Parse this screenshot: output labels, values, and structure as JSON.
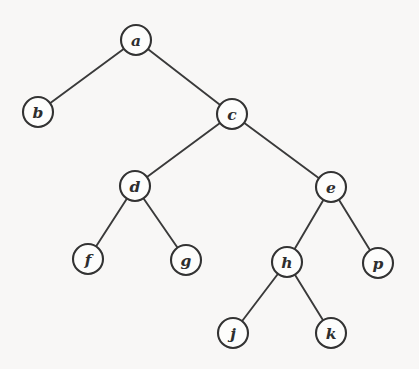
{
  "figure": {
    "background_color": "#f8f7f6",
    "stroke_color": "#333333",
    "label_color": "#2e2e2e",
    "node_fill_color": "#fdfdfc",
    "node_radius": 15
  },
  "chart_data": {
    "type": "diagram",
    "diagram_type": "binary-tree",
    "title": "",
    "root": "a",
    "nodes": [
      {
        "id": "a",
        "label": "a",
        "x": 136,
        "y": 40,
        "depth": 0
      },
      {
        "id": "b",
        "label": "b",
        "x": 38,
        "y": 112,
        "depth": 1
      },
      {
        "id": "c",
        "label": "c",
        "x": 232,
        "y": 114,
        "depth": 1
      },
      {
        "id": "d",
        "label": "d",
        "x": 135,
        "y": 186,
        "depth": 2
      },
      {
        "id": "e",
        "label": "e",
        "x": 331,
        "y": 187,
        "depth": 2
      },
      {
        "id": "f",
        "label": "f",
        "x": 88,
        "y": 259,
        "depth": 3
      },
      {
        "id": "g",
        "label": "g",
        "x": 186,
        "y": 260,
        "depth": 3
      },
      {
        "id": "h",
        "label": "h",
        "x": 287,
        "y": 262,
        "depth": 3
      },
      {
        "id": "p",
        "label": "p",
        "x": 378,
        "y": 263,
        "depth": 3
      },
      {
        "id": "j",
        "label": "j",
        "x": 233,
        "y": 333,
        "depth": 4
      },
      {
        "id": "k",
        "label": "k",
        "x": 331,
        "y": 333,
        "depth": 4
      }
    ],
    "edges": [
      {
        "from": "a",
        "to": "b",
        "side": "left"
      },
      {
        "from": "a",
        "to": "c",
        "side": "right"
      },
      {
        "from": "c",
        "to": "d",
        "side": "left"
      },
      {
        "from": "c",
        "to": "e",
        "side": "right"
      },
      {
        "from": "d",
        "to": "f",
        "side": "left"
      },
      {
        "from": "d",
        "to": "g",
        "side": "right"
      },
      {
        "from": "e",
        "to": "h",
        "side": "left"
      },
      {
        "from": "e",
        "to": "p",
        "side": "right"
      },
      {
        "from": "h",
        "to": "j",
        "side": "left"
      },
      {
        "from": "h",
        "to": "k",
        "side": "right"
      }
    ]
  }
}
